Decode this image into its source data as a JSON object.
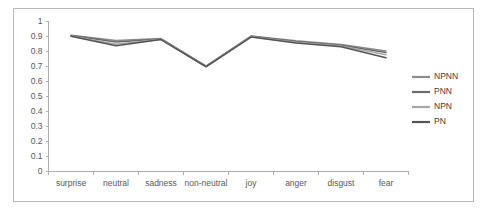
{
  "chart_data": {
    "type": "line",
    "title": "",
    "xlabel": "",
    "ylabel": "",
    "categories": [
      "surprise",
      "neutral",
      "sadness",
      "non-neutral",
      "joy",
      "anger",
      "disgust",
      "fear"
    ],
    "ylim": [
      0,
      1
    ],
    "ytick_labels": [
      "0",
      "0.1",
      "0.2",
      "0.3",
      "0.4",
      "0.5",
      "0.6",
      "0.7",
      "0.8",
      "0.9",
      "1"
    ],
    "ytick_values": [
      0,
      0.1,
      0.2,
      0.3,
      0.4,
      0.5,
      0.6,
      0.7,
      0.8,
      0.9,
      1
    ],
    "grid": false,
    "legend_position": "right",
    "series": [
      {
        "name": "NPNN",
        "color": "#8c8c8c",
        "values": [
          0.905,
          0.87,
          0.883,
          0.7,
          0.9,
          0.868,
          0.843,
          0.8
        ]
      },
      {
        "name": "PNN",
        "color": "#6b6b6b",
        "values": [
          0.903,
          0.86,
          0.88,
          0.698,
          0.898,
          0.863,
          0.838,
          0.79
        ]
      },
      {
        "name": "NPN",
        "color": "#a6a6a6",
        "values": [
          0.9,
          0.845,
          0.878,
          0.697,
          0.895,
          0.858,
          0.833,
          0.775
        ]
      },
      {
        "name": "PN",
        "color": "#555555",
        "values": [
          0.898,
          0.835,
          0.876,
          0.695,
          0.893,
          0.853,
          0.828,
          0.755
        ]
      }
    ]
  },
  "legend": {
    "items": [
      {
        "label": "NPNN"
      },
      {
        "label": "PNN"
      },
      {
        "label": "NPN"
      },
      {
        "label": "PN"
      }
    ]
  }
}
